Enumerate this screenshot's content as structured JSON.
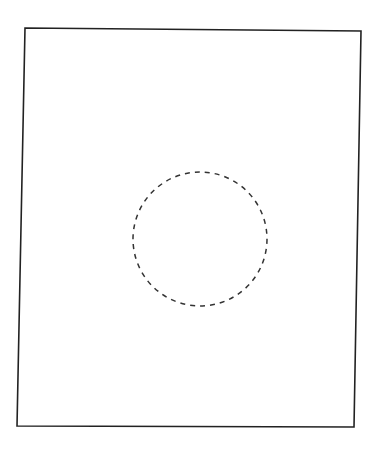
{
  "diagram": {
    "background": "#ffffff",
    "frame": {
      "points": "25,28 361,31 354,427 17,426",
      "stroke": "#222222",
      "stroke_width": 1.6
    },
    "circle": {
      "cx": 200,
      "cy": 239,
      "rx": 67,
      "ry": 67,
      "stroke": "#333333",
      "stroke_width": 1.5,
      "dasharray": "5 5"
    }
  }
}
